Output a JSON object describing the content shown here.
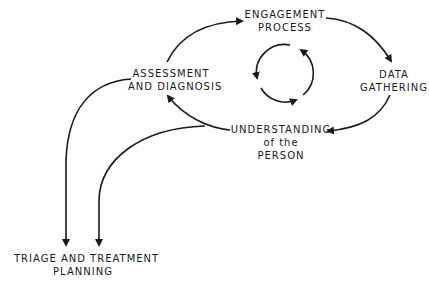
{
  "nodes": {
    "engagement": {
      "line1": "ENGAGEMENT",
      "line2": "PROCESS"
    },
    "data_gathering": {
      "line1": "DATA",
      "line2": "GATHERING"
    },
    "understanding": {
      "line1": "UNDERSTANDING",
      "line2": "of the",
      "line3": "PERSON"
    },
    "assessment": {
      "line1": "ASSESSMENT",
      "line2": "AND DIAGNOSIS"
    },
    "triage": {
      "line1": "TRIAGE AND TREATMENT",
      "line2": "PLANNING"
    }
  },
  "edges": [
    {
      "from": "assessment",
      "to": "engagement"
    },
    {
      "from": "engagement",
      "to": "data_gathering"
    },
    {
      "from": "data_gathering",
      "to": "understanding"
    },
    {
      "from": "understanding",
      "to": "assessment"
    },
    {
      "from": "assessment",
      "to": "triage"
    },
    {
      "from": "understanding",
      "to": "triage"
    }
  ],
  "center_cycle": {
    "type": "circular-arrows",
    "count": 3
  },
  "colors": {
    "stroke": "#1a1a1a",
    "background": "#ffffff"
  }
}
